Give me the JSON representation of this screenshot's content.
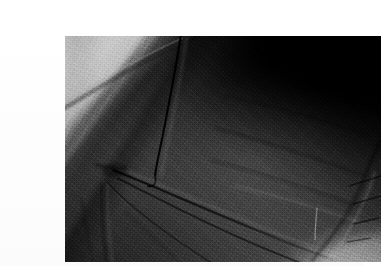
{
  "page": {
    "background_color": "#ffffff",
    "width": 363,
    "height": 266
  },
  "photo": {
    "alt_text": "Grayscale photograph of a dark folded garment sleeve and cuff",
    "subject": "dark garment / folded cloth sleeve with gathered cuff",
    "medium": "black and white photograph",
    "frame": {
      "left": 25,
      "top": 20,
      "width": 316,
      "height": 226,
      "border_color": "#ffffff"
    },
    "tones": {
      "darkest": "#000000",
      "shadow": "#141414",
      "mid_dark": "#2e2e2e",
      "mid": "#474747",
      "mid_light": "#6d6d6d",
      "background_light": "#c9c9c9",
      "highlight": "#d6d6d6"
    },
    "regions": [
      {
        "name": "background-wedge-upper-left",
        "tone": "#c7c7c7",
        "description": "pale studio background visible above the shoulder"
      },
      {
        "name": "deep-shadow-upper-right",
        "tone": "#040404",
        "description": "near black shadow filling the top right corner"
      },
      {
        "name": "sleeve-fold-diagonal",
        "tone": "#2a2a2a",
        "description": "sleeve edge running from upper left to centre"
      },
      {
        "name": "body-plane-right",
        "tone": "#565656",
        "description": "broad lit plane of cloth on the right half"
      },
      {
        "name": "gathered-cuff-lower-right",
        "tone": "#6a6a6a",
        "description": "bunched cuff folds near the lower right corner"
      },
      {
        "name": "background-light-lower-right",
        "tone": "#cccccc",
        "description": "pale background beyond the cuff"
      }
    ],
    "creases": [
      {
        "name": "vertical-crease-top-centre",
        "from": [
          112,
          2
        ],
        "to": [
          92,
          142
        ]
      },
      {
        "name": "convergence-point",
        "at": [
          52,
          136
        ]
      },
      {
        "name": "diagonal-crease-primary",
        "from": [
          52,
          136
        ],
        "to": [
          260,
          222
        ]
      },
      {
        "name": "diagonal-crease-secondary",
        "from": [
          56,
          142
        ],
        "to": [
          236,
          226
        ]
      },
      {
        "name": "diagonal-crease-tertiary",
        "from": [
          44,
          150
        ],
        "to": [
          150,
          226
        ]
      },
      {
        "name": "shoulder-fold-edge",
        "from": [
          0,
          60
        ],
        "to": [
          150,
          4
        ]
      }
    ]
  }
}
